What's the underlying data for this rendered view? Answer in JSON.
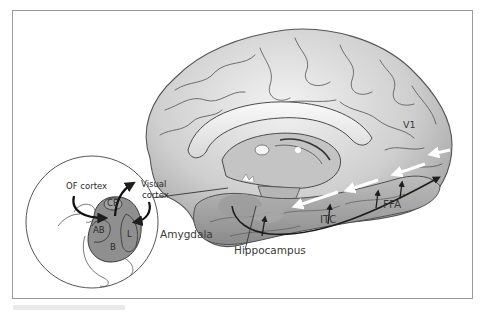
{
  "figure": {
    "labels": {
      "v1": "V1",
      "ffa": "FFA",
      "itc": "ITC",
      "hippocampus": "Hippocampus",
      "amygdala": "Amygdala",
      "visual_cortex": "Visual\ncortex",
      "visual_cortex_line1": "Visual",
      "visual_cortex_line2": "cortex",
      "of_cortex": "OF cortex"
    },
    "inset_nuclei": {
      "ce": "CE",
      "ab": "AB",
      "b": "B",
      "l": "L"
    },
    "colors": {
      "frame_border": "#9a9a9a",
      "brain_fill": "#d4d4d4",
      "brain_shadow": "#9c9c9c",
      "amygdala_fill": "#8f8f8f",
      "pathway_dark": "#1e1e1e",
      "pathway_light": "#ffffff",
      "label_text": "#3a3a3a"
    }
  }
}
